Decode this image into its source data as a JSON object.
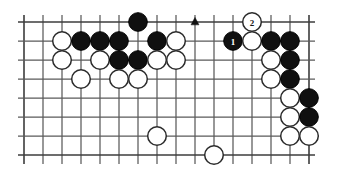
{
  "figure": {
    "kind": "go-board-diagram",
    "title": "",
    "board": {
      "columns": 16,
      "rows": 8,
      "origin_x": 24,
      "origin_y": 22,
      "spacing": 19,
      "stone_radius": 9.3,
      "line_color": "#5a5a5a",
      "edge_color": "#3c3c3c",
      "black_color": "#101010",
      "white_color": "#ffffff",
      "background": "#ffffff",
      "overhang_top": 7,
      "overhang_bottom": 9,
      "overhang_left": 6,
      "overhang_right": 6
    },
    "hoshi": [
      {
        "col": 2,
        "row": 2
      }
    ],
    "stones": [
      {
        "col": 6,
        "row": 0,
        "color": "black",
        "label": ""
      },
      {
        "col": 2,
        "row": 1,
        "color": "white",
        "label": ""
      },
      {
        "col": 3,
        "row": 1,
        "color": "black",
        "label": ""
      },
      {
        "col": 4,
        "row": 1,
        "color": "black",
        "label": ""
      },
      {
        "col": 5,
        "row": 1,
        "color": "black",
        "label": ""
      },
      {
        "col": 7,
        "row": 1,
        "color": "black",
        "label": ""
      },
      {
        "col": 8,
        "row": 1,
        "color": "white",
        "label": ""
      },
      {
        "col": 11,
        "row": 1,
        "color": "black",
        "label": "1"
      },
      {
        "col": 12,
        "row": 1,
        "color": "white",
        "label": ""
      },
      {
        "col": 13,
        "row": 1,
        "color": "black",
        "label": ""
      },
      {
        "col": 14,
        "row": 1,
        "color": "black",
        "label": ""
      },
      {
        "col": 2,
        "row": 2,
        "color": "white",
        "label": ""
      },
      {
        "col": 4,
        "row": 2,
        "color": "white",
        "label": ""
      },
      {
        "col": 5,
        "row": 2,
        "color": "black",
        "label": ""
      },
      {
        "col": 6,
        "row": 2,
        "color": "black",
        "label": ""
      },
      {
        "col": 7,
        "row": 2,
        "color": "white",
        "label": ""
      },
      {
        "col": 8,
        "row": 2,
        "color": "white",
        "label": ""
      },
      {
        "col": 13,
        "row": 2,
        "color": "white",
        "label": ""
      },
      {
        "col": 14,
        "row": 2,
        "color": "black",
        "label": ""
      },
      {
        "col": 3,
        "row": 3,
        "color": "white",
        "label": ""
      },
      {
        "col": 5,
        "row": 3,
        "color": "white",
        "label": ""
      },
      {
        "col": 6,
        "row": 3,
        "color": "white",
        "label": ""
      },
      {
        "col": 13,
        "row": 3,
        "color": "white",
        "label": ""
      },
      {
        "col": 14,
        "row": 3,
        "color": "black",
        "label": ""
      },
      {
        "col": 14,
        "row": 4,
        "color": "white",
        "label": ""
      },
      {
        "col": 15,
        "row": 4,
        "color": "black",
        "label": ""
      },
      {
        "col": 14,
        "row": 5,
        "color": "white",
        "label": ""
      },
      {
        "col": 15,
        "row": 5,
        "color": "black",
        "label": ""
      },
      {
        "col": 7,
        "row": 6,
        "color": "white",
        "label": ""
      },
      {
        "col": 14,
        "row": 6,
        "color": "white",
        "label": ""
      },
      {
        "col": 15,
        "row": 6,
        "color": "white",
        "label": ""
      },
      {
        "col": 10,
        "row": 7,
        "color": "white",
        "label": ""
      }
    ],
    "markers": [
      {
        "col": 9,
        "row": 0,
        "shape": "triangle"
      }
    ],
    "white_numbered_stone": {
      "col": 12,
      "row": 0,
      "color": "white",
      "label": "2"
    }
  }
}
